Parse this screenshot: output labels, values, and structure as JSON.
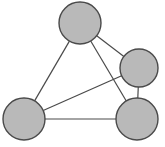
{
  "figure": {
    "kind": "undirected-graph-diagram",
    "width": 165,
    "height": 147,
    "background_color": "#ffffff",
    "title": "",
    "caption": ""
  },
  "style": {
    "node_fill_color": "#b9b9b9",
    "node_stroke_color": "#4a4a4a",
    "node_stroke_width": 1.4,
    "edge_stroke_color": "#4a4a4a",
    "edge_stroke_width": 1.2
  },
  "graph": {
    "node_count": 4,
    "edge_count": 6,
    "nodes": [
      {
        "id": "n1",
        "label": "",
        "cx": 80,
        "cy": 23,
        "r": 21,
        "position_name": "top"
      },
      {
        "id": "n2",
        "label": "",
        "cx": 139,
        "cy": 68,
        "r": 19,
        "position_name": "upper-right"
      },
      {
        "id": "n3",
        "label": "",
        "cx": 24,
        "cy": 119,
        "r": 21,
        "position_name": "lower-left"
      },
      {
        "id": "n4",
        "label": "",
        "cx": 137,
        "cy": 119,
        "r": 21,
        "position_name": "lower-right"
      }
    ],
    "edges": [
      {
        "id": "e1",
        "source": "n1",
        "target": "n2",
        "label": ""
      },
      {
        "id": "e2",
        "source": "n1",
        "target": "n3",
        "label": ""
      },
      {
        "id": "e3",
        "source": "n1",
        "target": "n4",
        "label": ""
      },
      {
        "id": "e4",
        "source": "n3",
        "target": "n2",
        "label": ""
      },
      {
        "id": "e5",
        "source": "n3",
        "target": "n4",
        "label": ""
      },
      {
        "id": "e6",
        "source": "n2",
        "target": "n4",
        "label": ""
      }
    ]
  }
}
